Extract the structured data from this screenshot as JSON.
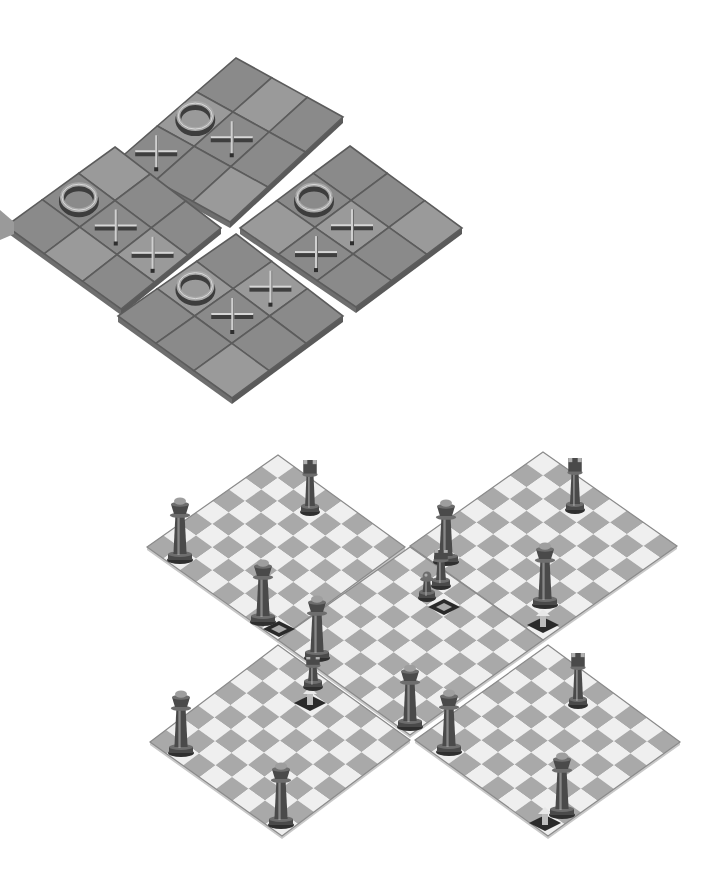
{
  "title": "",
  "colors": {
    "background": "#ffffff",
    "ttt_tile_dark": "#8a8a8a",
    "ttt_tile_light": "#9c9c9c",
    "ttt_grid_line": "#5c5c5c",
    "chess_light": "#efefef",
    "chess_dark": "#a9a9a9",
    "piece_body": "#5a5a5a",
    "piece_highlight": "#b8b8b8"
  },
  "tictactoe": {
    "description": "Four isometric 3x3 tic-tac-toe boards arranged in a diamond",
    "boards": [
      {
        "name": "top",
        "top": [
          236,
          58
        ],
        "right": [
          343,
          117
        ],
        "bottom": [
          230,
          222
        ],
        "left": [
          118,
          160
        ],
        "cells": [
          [
            "",
            "",
            ""
          ],
          [
            "O",
            "X",
            ""
          ],
          [
            "X",
            "",
            ""
          ]
        ]
      },
      {
        "name": "left",
        "top": [
          115,
          147
        ],
        "right": [
          221,
          228
        ],
        "bottom": [
          121,
          309
        ],
        "left": [
          6,
          226
        ],
        "cells": [
          [
            "",
            "",
            ""
          ],
          [
            "O",
            "X",
            "X"
          ],
          [
            "",
            "",
            ""
          ]
        ]
      },
      {
        "name": "right",
        "top": [
          350,
          146
        ],
        "right": [
          462,
          228
        ],
        "bottom": [
          356,
          307
        ],
        "left": [
          240,
          228
        ],
        "cells": [
          [
            "",
            "",
            ""
          ],
          [
            "O",
            "X",
            ""
          ],
          [
            "",
            "X",
            ""
          ]
        ]
      },
      {
        "name": "bottom",
        "top": [
          236,
          234
        ],
        "right": [
          343,
          316
        ],
        "bottom": [
          232,
          398
        ],
        "left": [
          118,
          316
        ],
        "cells": [
          [
            "",
            "X",
            ""
          ],
          [
            "O",
            "X",
            ""
          ],
          [
            "",
            "",
            ""
          ]
        ]
      }
    ]
  },
  "chess": {
    "description": "Five isometric 8x8 chessboards arranged in a cross (center plus four corners)",
    "boards": [
      {
        "name": "top-left",
        "top": [
          278,
          455
        ],
        "right": [
          405,
          547
        ],
        "bottom": [
          278,
          640
        ],
        "left": [
          147,
          547
        ]
      },
      {
        "name": "top-right",
        "top": [
          543,
          452
        ],
        "right": [
          677,
          546
        ],
        "bottom": [
          543,
          640
        ],
        "left": [
          410,
          546
        ]
      },
      {
        "name": "center",
        "top": [
          410,
          547
        ],
        "right": [
          543,
          640
        ],
        "bottom": [
          410,
          735
        ],
        "left": [
          278,
          640
        ]
      },
      {
        "name": "bottom-left",
        "top": [
          278,
          645
        ],
        "right": [
          410,
          740
        ],
        "bottom": [
          282,
          836
        ],
        "left": [
          150,
          742
        ]
      },
      {
        "name": "bottom-right",
        "top": [
          548,
          645
        ],
        "right": [
          680,
          742
        ],
        "bottom": [
          548,
          836
        ],
        "left": [
          415,
          740
        ]
      }
    ],
    "pieces": [
      {
        "type": "king",
        "x": 180,
        "y": 560,
        "h": 62
      },
      {
        "type": "rook",
        "x": 310,
        "y": 512,
        "h": 52
      },
      {
        "type": "king",
        "x": 263,
        "y": 622,
        "h": 62
      },
      {
        "type": "king",
        "x": 317,
        "y": 658,
        "h": 62
      },
      {
        "type": "king",
        "x": 446,
        "y": 562,
        "h": 62
      },
      {
        "type": "rook",
        "x": 441,
        "y": 586,
        "h": 36
      },
      {
        "type": "pawn",
        "x": 427,
        "y": 598,
        "h": 26
      },
      {
        "type": "rook",
        "x": 575,
        "y": 510,
        "h": 52
      },
      {
        "type": "king",
        "x": 545,
        "y": 605,
        "h": 62
      },
      {
        "type": "rook",
        "x": 313,
        "y": 687,
        "h": 30
      },
      {
        "type": "king",
        "x": 410,
        "y": 727,
        "h": 62
      },
      {
        "type": "king",
        "x": 181,
        "y": 753,
        "h": 62
      },
      {
        "type": "king",
        "x": 281,
        "y": 825,
        "h": 62
      },
      {
        "type": "king",
        "x": 449,
        "y": 752,
        "h": 62
      },
      {
        "type": "rook",
        "x": 578,
        "y": 705,
        "h": 52
      },
      {
        "type": "king",
        "x": 562,
        "y": 815,
        "h": 62
      }
    ],
    "move_markers": [
      {
        "x": 279,
        "y": 629,
        "kind": "outline"
      },
      {
        "x": 444,
        "y": 607,
        "kind": "outline"
      },
      {
        "x": 543,
        "y": 625,
        "kind": "arrow"
      },
      {
        "x": 310,
        "y": 703,
        "kind": "arrow"
      },
      {
        "x": 545,
        "y": 823,
        "kind": "arrow-corner"
      }
    ]
  }
}
